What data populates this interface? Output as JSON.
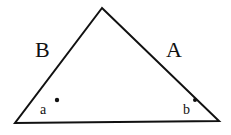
{
  "diagram": {
    "shape": "triangle",
    "vertices": {
      "apex": [
        102,
        8
      ],
      "bottom_left": [
        15,
        123
      ],
      "bottom_right": [
        219,
        121
      ]
    },
    "stroke_color": "#111111",
    "sides": [
      {
        "id": "left",
        "label": "B",
        "pos": [
          35,
          57
        ]
      },
      {
        "id": "right",
        "label": "A",
        "pos": [
          166,
          57
        ]
      }
    ],
    "angles": [
      {
        "id": "bottom-left",
        "label": "a",
        "label_pos": [
          40,
          114
        ],
        "dot": [
          57,
          100
        ]
      },
      {
        "id": "bottom-right",
        "label": "b",
        "label_pos": [
          183,
          114
        ],
        "dot": [
          195,
          100
        ]
      }
    ]
  }
}
